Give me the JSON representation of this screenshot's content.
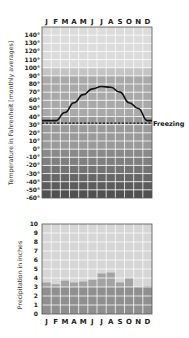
{
  "chart_data": [
    {
      "type": "line",
      "title": "",
      "xlabel": "",
      "ylabel": "Temperature in Fahrenheit [monthly averages]",
      "categories": [
        "J",
        "F",
        "M",
        "A",
        "M",
        "J",
        "J",
        "A",
        "S",
        "O",
        "N",
        "D"
      ],
      "series": [
        {
          "name": "Temperature",
          "values": [
            35,
            35,
            45,
            57,
            67,
            74,
            77,
            76,
            70,
            57,
            50,
            35
          ]
        }
      ],
      "yticks": [
        "140°",
        "130°",
        "120°",
        "110°",
        "100°",
        "90°",
        "80°",
        "70°",
        "60°",
        "50°",
        "40°",
        "30°",
        "20°",
        "10°",
        "0°",
        "-10°",
        "-20°",
        "-30°",
        "-40°",
        "-50°",
        "-60°"
      ],
      "ylim": [
        -60,
        150
      ],
      "grid": true,
      "annotations": [
        {
          "label": "Freezing",
          "y": 32,
          "style": "dashed"
        }
      ]
    },
    {
      "type": "bar",
      "title": "",
      "xlabel": "",
      "ylabel": "Precipitation in inches",
      "categories": [
        "J",
        "F",
        "M",
        "A",
        "M",
        "J",
        "J",
        "A",
        "S",
        "O",
        "N",
        "D"
      ],
      "values": [
        3.5,
        3.3,
        3.7,
        3.5,
        3.6,
        3.8,
        4.5,
        4.6,
        3.5,
        4.0,
        2.8,
        3.1
      ],
      "yticks": [
        "10",
        "9",
        "8",
        "7",
        "6",
        "5",
        "4",
        "3",
        "2",
        "1",
        "0"
      ],
      "ylim": [
        0,
        10
      ],
      "grid": true
    }
  ],
  "labels": {
    "months": [
      "J",
      "F",
      "M",
      "A",
      "M",
      "J",
      "J",
      "A",
      "S",
      "O",
      "N",
      "D"
    ],
    "temp_axis_title": "Temperature in Fahrenheit [monthly averages]",
    "precip_axis_title": "Precipitation in inches",
    "freezing": "Freezing"
  },
  "colors": {
    "line": "#111111",
    "grid": "#ffffff",
    "frame": "#444444"
  }
}
